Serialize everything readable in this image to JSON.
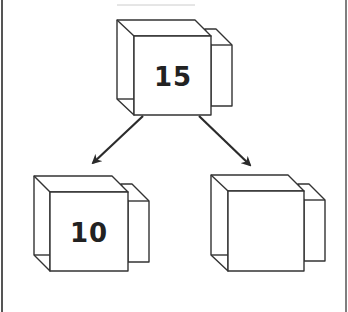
{
  "diagram": {
    "type": "tree",
    "colors": {
      "stroke": "#333333",
      "arrow": "#2b2b2b",
      "background": "#ffffff",
      "text": "#222222"
    },
    "nodes": [
      {
        "id": "root",
        "label": "15"
      },
      {
        "id": "left-child",
        "label": "10"
      },
      {
        "id": "right-child",
        "label": ""
      }
    ],
    "edges": [
      {
        "from": "root",
        "to": "left-child"
      },
      {
        "from": "root",
        "to": "right-child"
      }
    ]
  }
}
